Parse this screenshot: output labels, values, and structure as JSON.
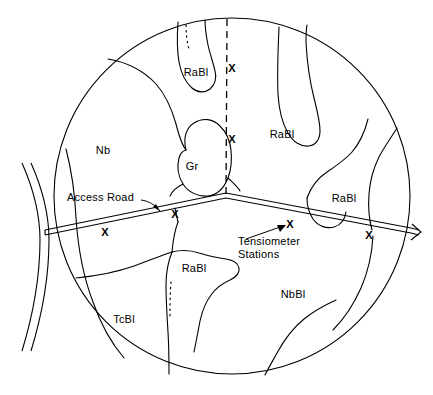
{
  "figure": {
    "type": "soil-map-diagram",
    "shape": "circle",
    "background_color": "#ffffff",
    "line_color": "#000000"
  },
  "soil_units": [
    {
      "code": "RaBl",
      "x": 196,
      "y": 76,
      "name": "soil-unit-rabl-north"
    },
    {
      "code": "RaBl",
      "x": 282,
      "y": 138,
      "name": "soil-unit-rabl-northeast"
    },
    {
      "code": "RaBl",
      "x": 344,
      "y": 202,
      "name": "soil-unit-rabl-east"
    },
    {
      "code": "RaBl",
      "x": 194,
      "y": 272,
      "name": "soil-unit-rabl-south"
    },
    {
      "code": "Nb",
      "x": 103,
      "y": 154,
      "name": "soil-unit-nb"
    },
    {
      "code": "Gr",
      "x": 192,
      "y": 170,
      "name": "soil-unit-gr"
    },
    {
      "code": "NbBl",
      "x": 293,
      "y": 298,
      "name": "soil-unit-nbbl"
    },
    {
      "code": "TcBl",
      "x": 124,
      "y": 323,
      "name": "soil-unit-tcbl"
    }
  ],
  "annotations": {
    "access_road": {
      "label": "Access Road",
      "x": 67,
      "y": 201
    },
    "tensiometer_stations": {
      "line1": "Tensiometer",
      "line2": "Stations",
      "x": 238,
      "y": 245
    }
  },
  "stations": {
    "marker": "X",
    "positions": [
      {
        "x": 232,
        "y": 72,
        "name": "station-marker-transect-1"
      },
      {
        "x": 232,
        "y": 143,
        "name": "station-marker-transect-2"
      },
      {
        "x": 175,
        "y": 218,
        "name": "station-marker-road-2"
      },
      {
        "x": 105,
        "y": 236,
        "name": "station-marker-road-1"
      },
      {
        "x": 290,
        "y": 228,
        "name": "station-marker-road-3"
      },
      {
        "x": 369,
        "y": 239,
        "name": "station-marker-road-4"
      }
    ]
  },
  "geometry": {
    "circle": {
      "cx": 232,
      "cy": 196,
      "r": 178
    },
    "transect_dashed": {
      "x": 227,
      "y_top": 19,
      "y_bottom": 196
    },
    "road_apex": {
      "x": 226,
      "y": 196
    }
  }
}
